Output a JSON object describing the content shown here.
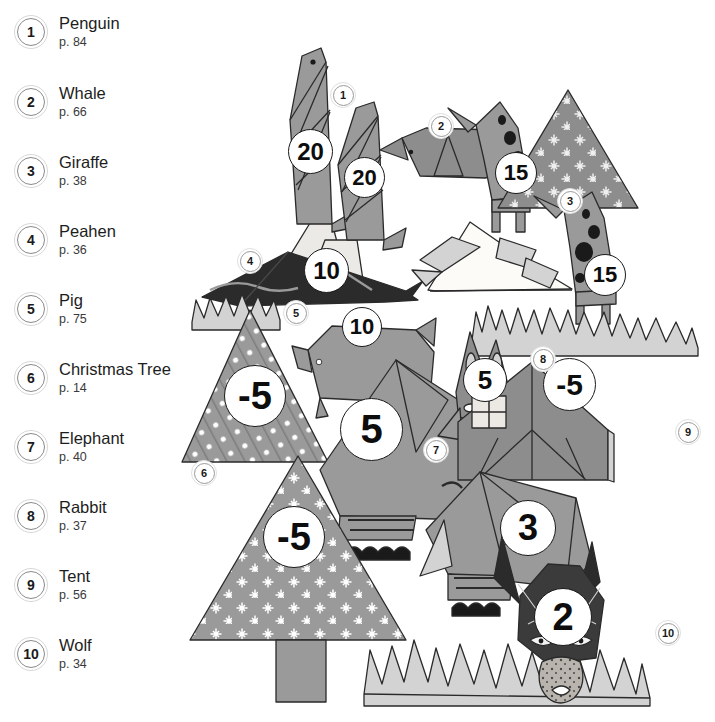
{
  "legend": {
    "items": [
      {
        "marker": "1",
        "title": "Penguin",
        "page": "p. 84"
      },
      {
        "marker": "2",
        "title": "Whale",
        "page": "p. 66"
      },
      {
        "marker": "3",
        "title": "Giraffe",
        "page": "p. 38"
      },
      {
        "marker": "4",
        "title": "Peahen",
        "page": "p. 36"
      },
      {
        "marker": "5",
        "title": "Pig",
        "page": "p. 75"
      },
      {
        "marker": "6",
        "title": "Christmas Tree",
        "page": "p. 14"
      },
      {
        "marker": "7",
        "title": "Elephant",
        "page": "p. 40"
      },
      {
        "marker": "8",
        "title": "Rabbit",
        "page": "p. 37"
      },
      {
        "marker": "9",
        "title": "Tent",
        "page": "p. 56"
      },
      {
        "marker": "10",
        "title": "Wolf",
        "page": "p. 34"
      }
    ]
  },
  "scene": {
    "markers": [
      {
        "id": "1",
        "label": "1"
      },
      {
        "id": "2",
        "label": "2"
      },
      {
        "id": "3",
        "label": "3"
      },
      {
        "id": "4",
        "label": "4"
      },
      {
        "id": "5",
        "label": "5"
      },
      {
        "id": "6",
        "label": "6"
      },
      {
        "id": "7",
        "label": "7"
      },
      {
        "id": "8",
        "label": "8"
      },
      {
        "id": "9",
        "label": "9"
      },
      {
        "id": "10",
        "label": "10"
      }
    ],
    "badges": [
      {
        "figure": "penguin-left",
        "value": "20"
      },
      {
        "figure": "penguin-right",
        "value": "20"
      },
      {
        "figure": "peahen",
        "value": "10"
      },
      {
        "figure": "giraffe-left",
        "value": "15"
      },
      {
        "figure": "giraffe-right",
        "value": "15"
      },
      {
        "figure": "pig",
        "value": "10"
      },
      {
        "figure": "christmas-tree-dots",
        "value": "-5"
      },
      {
        "figure": "christmas-tree-stars",
        "value": "-5"
      },
      {
        "figure": "elephant-large",
        "value": "5"
      },
      {
        "figure": "elephant-small",
        "value": "3"
      },
      {
        "figure": "rabbit",
        "value": "5"
      },
      {
        "figure": "tent",
        "value": "-5"
      },
      {
        "figure": "wolf",
        "value": "2"
      }
    ]
  },
  "colors": {
    "paper_mid": "#9a9a9a",
    "paper_dark": "#6f6f6f",
    "paper_light": "#d3d3d3",
    "paper_pale": "#eceae6",
    "paper_black": "#2b2b2b",
    "outline": "#2a2a2a",
    "background": "#ffffff",
    "legend_text": "#1d1d1d"
  }
}
